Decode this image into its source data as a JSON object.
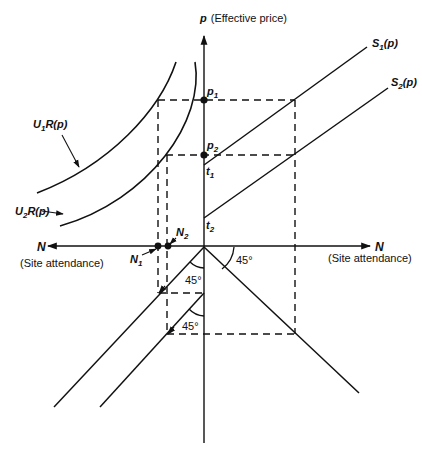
{
  "diagram": {
    "vertical_axis": {
      "symbol": "p",
      "label": "(Effective price)"
    },
    "horizontal_axis_left": {
      "symbol": "N",
      "label": "(Site attendance)"
    },
    "horizontal_axis_right": {
      "symbol": "N",
      "label": "(Site attendance)"
    },
    "curves": {
      "u1": {
        "base": "U",
        "sub": "1",
        "tail": "R(p)"
      },
      "u2": {
        "base": "U",
        "sub": "2",
        "tail": "R(p)"
      },
      "s1": {
        "base": "S",
        "sub": "1",
        "tail": "(p)"
      },
      "s2": {
        "base": "S",
        "sub": "2",
        "tail": "(p)"
      }
    },
    "points": {
      "p1": {
        "base": "p",
        "sub": "1"
      },
      "p2": {
        "base": "p",
        "sub": "2"
      },
      "t1": {
        "base": "t",
        "sub": "1"
      },
      "t2": {
        "base": "t",
        "sub": "2"
      },
      "n1": {
        "base": "N",
        "sub": "1"
      },
      "n2": {
        "base": "N",
        "sub": "2"
      }
    },
    "angles": {
      "right_upper": "45°",
      "left_upper": "45°",
      "left_lower": "45°"
    }
  }
}
